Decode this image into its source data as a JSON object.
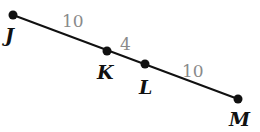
{
  "diagram": {
    "type": "line-segment",
    "colors": {
      "line": "#111111",
      "point": "#111111",
      "segment_label": "#8a8a8a"
    },
    "points": [
      {
        "name": "J",
        "x": 13,
        "y": 15,
        "lx": 5,
        "ly": 42
      },
      {
        "name": "K",
        "x": 107,
        "y": 51,
        "lx": 97,
        "ly": 79
      },
      {
        "name": "L",
        "x": 145,
        "y": 64,
        "lx": 139,
        "ly": 94
      },
      {
        "name": "M",
        "x": 238,
        "y": 99,
        "lx": 229,
        "ly": 126
      }
    ],
    "segments": [
      {
        "from": "J",
        "to": "K",
        "length": "10",
        "lx": 62,
        "ly": 27
      },
      {
        "from": "K",
        "to": "L",
        "length": "4",
        "lx": 120,
        "ly": 50
      },
      {
        "from": "L",
        "to": "M",
        "length": "10",
        "lx": 182,
        "ly": 77
      }
    ]
  }
}
